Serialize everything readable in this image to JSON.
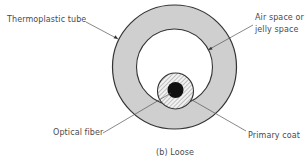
{
  "figure": {
    "caption": "(b) Loose"
  },
  "labels": {
    "thermoplastic_tube": "Thermoplastic tube",
    "air_space_line1": "Air space or",
    "air_space_line2": "jelly space",
    "optical_fiber": "Optical fiber",
    "primary_coat": "Primary coat"
  },
  "colors": {
    "tube_fill": "#cfcfcf",
    "outline": "#333333",
    "core": "#111111",
    "leader": "#555555",
    "text": "#4a4a4a",
    "background": "#ffffff"
  },
  "geometry": {
    "outer_circle": {
      "cx": 174.5,
      "cy": 67,
      "r": 62
    },
    "inner_circle": {
      "cx": 174.5,
      "cy": 67,
      "r": 38
    },
    "primary_coat_circle": {
      "cx": 175.5,
      "cy": 91,
      "r": 18
    },
    "core_circle": {
      "cx": 175.5,
      "cy": 90,
      "r": 8
    }
  }
}
